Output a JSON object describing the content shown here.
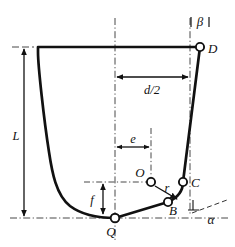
{
  "figure": {
    "type": "engineering-line-diagram",
    "colors": {
      "outline": "#111111",
      "construction": "#333333",
      "background": "#ffffff",
      "marker_fill": "#ffffff"
    },
    "points": [
      {
        "id": "D",
        "label": "D",
        "x": 200,
        "y": 47,
        "marker": "open-circle",
        "label_dx": 8,
        "label_dy": 6
      },
      {
        "id": "C",
        "label": "C",
        "x": 183,
        "y": 182,
        "marker": "open-circle",
        "label_dx": 8,
        "label_dy": 5
      },
      {
        "id": "B",
        "label": "B",
        "x": 168,
        "y": 202,
        "marker": "open-circle",
        "label_dx": 2,
        "label_dy": 13
      },
      {
        "id": "Q",
        "label": "Q",
        "x": 115,
        "y": 218,
        "marker": "open-circle",
        "label_dx": -4,
        "label_dy": 17
      },
      {
        "id": "O",
        "label": "O",
        "x": 151,
        "y": 182,
        "marker": "open-circle",
        "label_dx": -14,
        "label_dy": -6
      }
    ],
    "dimensions": [
      {
        "id": "L",
        "label": "L",
        "orientation": "vertical",
        "label_x": 22,
        "label_y": 136,
        "from": "top-rim",
        "to": "bottom-baseline"
      },
      {
        "id": "d/2",
        "label": "d/2",
        "orientation": "horizontal",
        "label_x": 158,
        "label_y": 92,
        "from": "axis-centerline",
        "to": "right-vertical-line"
      },
      {
        "id": "e",
        "label": "e",
        "orientation": "horizontal",
        "label_x": 131,
        "label_y": 148,
        "from": "axis-centerline",
        "to": "O-vertical-line"
      },
      {
        "id": "f",
        "label": "f",
        "orientation": "vertical",
        "label_x": 88,
        "label_y": 201,
        "from": "bottom-baseline",
        "to": "O-horizontal-line"
      },
      {
        "id": "r",
        "label": "r",
        "orientation": "radial",
        "label_x": 166,
        "label_y": 192,
        "from": "O",
        "to": "arc-BC"
      }
    ],
    "angles": [
      {
        "id": "beta",
        "label": "β",
        "label_x": 206,
        "label_y": 22,
        "between": "right-vertical-line and edge DC"
      },
      {
        "id": "alpha",
        "label": "α",
        "label_x": 211,
        "label_y": 222,
        "between": "bottom-baseline and slope through B"
      }
    ],
    "construction_lines": [
      {
        "id": "axis-centerline",
        "type": "dash-dot",
        "orientation": "vertical",
        "x": 115,
        "y1": 18,
        "y2": 240
      },
      {
        "id": "right-vertical-line",
        "type": "dash-dot",
        "orientation": "vertical",
        "x": 190,
        "y1": 18,
        "y2": 215
      },
      {
        "id": "O-vertical-line",
        "type": "dash-dot",
        "orientation": "vertical",
        "x": 151,
        "y1": 128,
        "y2": 186
      },
      {
        "id": "bottom-baseline",
        "type": "dash-dot",
        "orientation": "horizontal",
        "y": 218,
        "x1": 10,
        "x2": 228
      },
      {
        "id": "O-horizontal-line",
        "type": "dash-dot",
        "orientation": "horizontal",
        "y": 182,
        "x1": 84,
        "x2": 150
      },
      {
        "id": "top-rim-tick",
        "type": "dash",
        "orientation": "horizontal",
        "y": 47,
        "x1": 12,
        "x2": 34
      },
      {
        "id": "alpha-slope-line",
        "type": "dash",
        "orientation": "slanted",
        "x1": 192,
        "y1": 212,
        "x2": 226,
        "y2": 200
      }
    ],
    "profile": {
      "description": "Thick closed outline: rim D to left wall, steep left wall curving to flat bottom through Q, rising through B, arc to C, then slanted wall up to D",
      "stroke_width": 2.6
    }
  }
}
